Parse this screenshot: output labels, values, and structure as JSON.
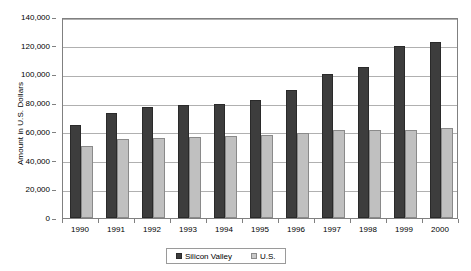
{
  "chart_data": {
    "type": "bar",
    "title": "",
    "xlabel": "",
    "ylabel": "Amount in U.S. Dollars",
    "categories": [
      "1990",
      "1991",
      "1992",
      "1993",
      "1994",
      "1995",
      "1996",
      "1997",
      "1998",
      "1999",
      "2000"
    ],
    "series": [
      {
        "name": "Silicon Valley",
        "color": "#3d3d3d",
        "values": [
          65000,
          73000,
          77500,
          79000,
          79500,
          82500,
          89500,
          100000,
          105000,
          120000,
          122500
        ]
      },
      {
        "name": "U.S.",
        "color": "#c0c0c0",
        "values": [
          50000,
          55000,
          56000,
          56500,
          57000,
          58000,
          59500,
          61000,
          61500,
          61500,
          62500
        ]
      }
    ],
    "ylim": [
      0,
      140000
    ],
    "ytick_step": 20000,
    "ytick_labels": [
      "0",
      "20,000",
      "40,000",
      "60,000",
      "80,000",
      "100,000",
      "120,000",
      "140,000"
    ],
    "ytick_values": [
      0,
      20000,
      40000,
      60000,
      80000,
      100000,
      120000,
      140000
    ],
    "grid": true,
    "grid_axis": "y",
    "legend_position": "bottom-center",
    "legend_entries": [
      "Silicon Valley",
      "U.S."
    ]
  }
}
